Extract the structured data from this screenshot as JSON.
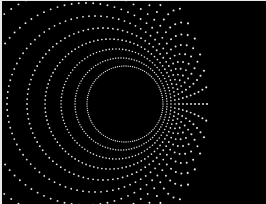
{
  "image": {
    "width": 266,
    "height": 204,
    "background": "#000000",
    "dot_color": "#e6e6e6",
    "border_color": "#e8e8e8",
    "subject": "concentric offset rings of white dots forming a tunnel/hole pattern"
  },
  "rings": [
    {
      "cx": 125,
      "cy": 104,
      "r": 38,
      "dots": 110,
      "size": 1.1
    },
    {
      "cx": 121,
      "cy": 104,
      "r": 46,
      "dots": 108,
      "size": 1.2
    },
    {
      "cx": 116,
      "cy": 104,
      "r": 55,
      "dots": 104,
      "size": 1.3
    },
    {
      "cx": 110,
      "cy": 104,
      "r": 65,
      "dots": 100,
      "size": 1.4
    },
    {
      "cx": 103,
      "cy": 104,
      "r": 76,
      "dots": 96,
      "size": 1.5
    },
    {
      "cx": 95,
      "cy": 104,
      "r": 88,
      "dots": 92,
      "size": 1.5
    },
    {
      "cx": 86,
      "cy": 104,
      "r": 101,
      "dots": 88,
      "size": 1.6
    },
    {
      "cx": 76,
      "cy": 104,
      "r": 115,
      "dots": 84,
      "size": 1.6
    },
    {
      "cx": 65,
      "cy": 104,
      "r": 130,
      "dots": 80,
      "size": 1.7
    },
    {
      "cx": 53,
      "cy": 104,
      "r": 146,
      "dots": 76,
      "size": 1.7
    },
    {
      "cx": 40,
      "cy": 104,
      "r": 163,
      "dots": 72,
      "size": 1.7
    },
    {
      "cx": 26,
      "cy": 104,
      "r": 181,
      "dots": 68,
      "size": 1.8
    }
  ]
}
